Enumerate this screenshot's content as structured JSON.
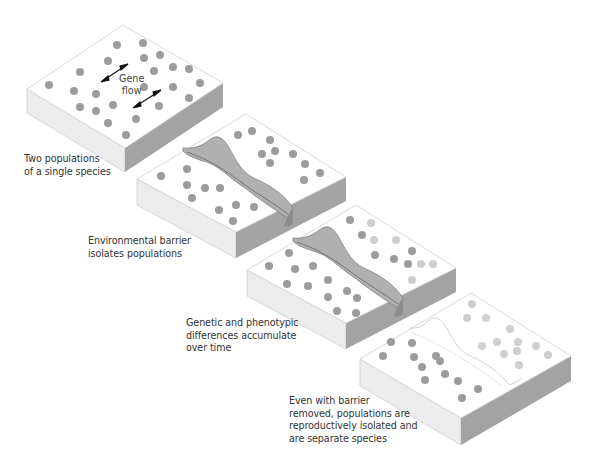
{
  "diagram": {
    "colors": {
      "top_face": "#ffffff",
      "edge": "#c8c8c8",
      "left_side": "#e8e8e8",
      "right_side": "#9e9e9e",
      "barrier_fill": "#b3b3b3",
      "barrier_dark": "#8f8f8f",
      "dot_ancestral": "#9a9a9a",
      "dot_diverged": "#cfcfcf"
    },
    "stages": [
      {
        "id": 1,
        "caption": "Two populations\nof a single species",
        "annotation": {
          "text": "Gene\nflow",
          "arrows": 2
        },
        "barrier": "none",
        "dots_left": 14,
        "dots_right": 11
      },
      {
        "id": 2,
        "caption": "Environmental barrier\nisolates populations",
        "barrier": "channel",
        "dots_left": 11,
        "dots_right": 11
      },
      {
        "id": 3,
        "caption": "Genetic and phenotypic\ndifferences accumulate\nover time",
        "barrier": "channel",
        "dots_left": 13,
        "dots_right_dark": 6,
        "dots_right_light": 6
      },
      {
        "id": 4,
        "caption": "Even with barrier\nremoved, populations are\nreproductively isolated and\nare separate species",
        "barrier": "removed",
        "dots_left": 10,
        "dots_right_light": 12
      }
    ]
  }
}
